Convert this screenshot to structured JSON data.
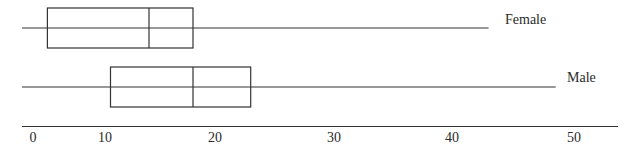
{
  "chart_data": {
    "type": "boxplot",
    "title": "",
    "xlabel": "",
    "ylabel": "",
    "orientation": "horizontal",
    "grid": false,
    "legend": "none (series labeled at right end of whiskers)",
    "xlim": [
      0,
      54
    ],
    "x_ticks": [
      0,
      10,
      20,
      30,
      40,
      50
    ],
    "x_tick_labels": [
      "0",
      "10",
      "20",
      "30",
      "40",
      "50"
    ],
    "series": [
      {
        "name": "Female",
        "min": -1,
        "q1": 2,
        "median": 14,
        "q3": 18,
        "max": 43
      },
      {
        "name": "Male",
        "min": -1,
        "q1": 10.5,
        "median": 18,
        "q3": 23,
        "max": 48.5
      }
    ]
  },
  "labels": {
    "female": "Female",
    "male": "Male",
    "ticks": [
      "0",
      "10",
      "20",
      "30",
      "40",
      "50"
    ]
  },
  "colors": {
    "line": "#333333",
    "text": "#2a2a2a",
    "background": "#ffffff"
  }
}
